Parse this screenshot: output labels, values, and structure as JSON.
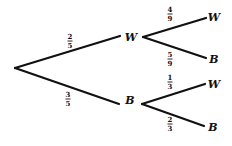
{
  "diagram": {
    "type": "probability-tree",
    "root": {
      "branches": [
        {
          "label": "W",
          "probability": {
            "num": "2",
            "den": "5"
          },
          "children": [
            {
              "label": "W",
              "probability": {
                "num": "4",
                "den": "9"
              }
            },
            {
              "label": "B",
              "probability": {
                "num": "5",
                "den": "9"
              }
            }
          ]
        },
        {
          "label": "B",
          "probability": {
            "num": "3",
            "den": "5"
          },
          "children": [
            {
              "label": "W",
              "probability": {
                "num": "1",
                "den": "3"
              }
            },
            {
              "label": "B",
              "probability": {
                "num": "2",
                "den": "3"
              }
            }
          ]
        }
      ]
    }
  }
}
